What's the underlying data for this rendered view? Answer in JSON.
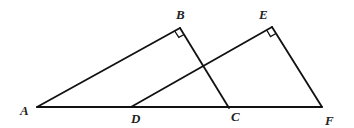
{
  "diagram": {
    "type": "geometry",
    "points": {
      "A": {
        "label": "A",
        "x": 37,
        "y": 107
      },
      "B": {
        "label": "B",
        "x": 180,
        "y": 28
      },
      "C": {
        "label": "C",
        "x": 229,
        "y": 108
      },
      "D": {
        "label": "D",
        "x": 131,
        "y": 107
      },
      "E": {
        "label": "E",
        "x": 272,
        "y": 27
      },
      "F": {
        "label": "F",
        "x": 322,
        "y": 107
      }
    },
    "segments": [
      "AF",
      "AB",
      "BC",
      "DE",
      "EF"
    ],
    "right_angles": [
      "B",
      "E"
    ],
    "labels": {
      "A": "A",
      "B": "B",
      "C": "C",
      "D": "D",
      "E": "E",
      "F": "F"
    }
  }
}
